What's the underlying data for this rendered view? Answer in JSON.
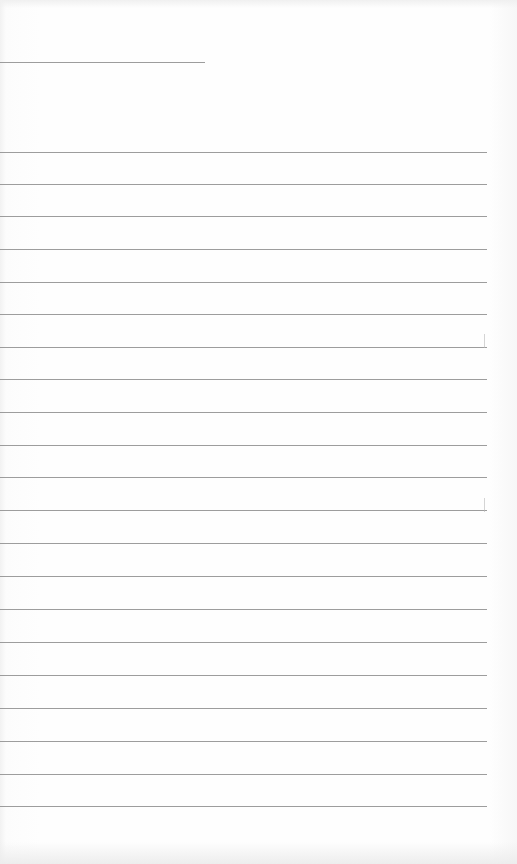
{
  "document": {
    "type": "blank lined sheet",
    "paper_color": "#fdfdfd",
    "line_color": "#8c8c8c",
    "header_line": {
      "y": 62,
      "x_start": 0,
      "x_end": 205
    },
    "ruled_lines": {
      "count": 21,
      "x_start": 0,
      "x_end": 487,
      "y_positions": [
        152,
        184,
        216,
        249,
        282,
        314,
        347,
        379,
        412,
        445,
        477,
        510,
        543,
        576,
        609,
        642,
        675,
        708,
        741,
        774,
        806
      ]
    }
  }
}
